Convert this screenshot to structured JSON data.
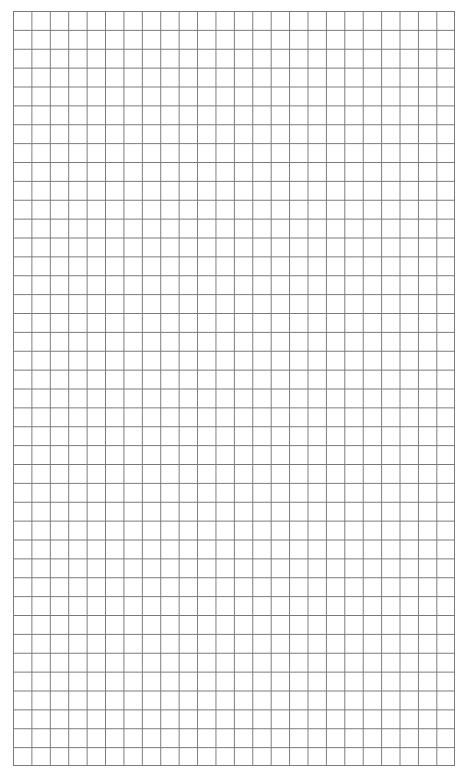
{
  "page": {
    "type": "graph-paper",
    "grid": {
      "columns": 24,
      "rows": 40,
      "line_color": "#7a7a7a",
      "background_color": "#ffffff"
    }
  }
}
